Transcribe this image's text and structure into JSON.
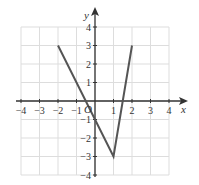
{
  "chart_data": {
    "type": "line",
    "title": "",
    "xlabel": "x",
    "ylabel": "y",
    "origin_label": "O",
    "xlim": [
      -4,
      4
    ],
    "ylim": [
      -4,
      4
    ],
    "grid": true,
    "x_ticks": [
      "-4",
      "-3",
      "-2",
      "-1",
      "1",
      "2",
      "3",
      "4"
    ],
    "y_ticks": [
      "4",
      "3",
      "2",
      "1",
      "-1",
      "-2",
      "-3",
      "-4"
    ],
    "series": [
      {
        "name": "piecewise linear",
        "points": [
          [
            -2,
            3
          ],
          [
            1,
            -3
          ],
          [
            2,
            3
          ]
        ],
        "color": "#555555"
      }
    ]
  }
}
